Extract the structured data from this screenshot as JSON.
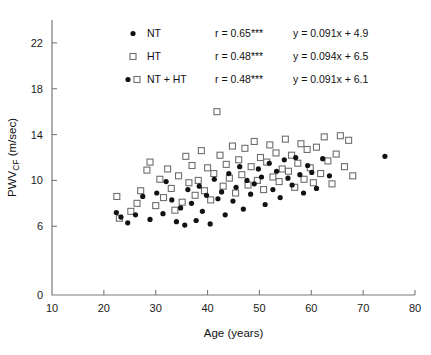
{
  "chart_data": {
    "type": "scatter",
    "title": "",
    "xlabel": "Age (years)",
    "ylabel": "PWV",
    "ylabel_sub": "CF",
    "ylabel_unit": " (m/sec)",
    "xlim": [
      10,
      80
    ],
    "ylim": [
      0,
      24
    ],
    "xticks": [
      10,
      20,
      30,
      40,
      50,
      60,
      70,
      80
    ],
    "yticks": [
      0,
      6,
      10,
      14,
      18,
      22
    ],
    "grid": false,
    "legend_position": "top-center",
    "series": [
      {
        "name": "NT",
        "marker": "filled-circle",
        "color": "#121212",
        "r": "r = 0.65***",
        "fit": "y = 0.091x + 4.9",
        "points": [
          [
            22.4,
            7.2
          ],
          [
            23.3,
            6.8
          ],
          [
            24.6,
            6.3
          ],
          [
            26.1,
            7.0
          ],
          [
            27.5,
            8.6
          ],
          [
            28.9,
            6.6
          ],
          [
            30.2,
            8.9
          ],
          [
            31.4,
            7.1
          ],
          [
            32.0,
            9.9
          ],
          [
            33.1,
            8.3
          ],
          [
            34.0,
            6.4
          ],
          [
            34.8,
            7.6
          ],
          [
            35.6,
            6.1
          ],
          [
            36.2,
            9.2
          ],
          [
            36.9,
            8.0
          ],
          [
            37.8,
            6.5
          ],
          [
            38.4,
            9.5
          ],
          [
            39.0,
            7.3
          ],
          [
            39.8,
            8.7
          ],
          [
            40.5,
            6.2
          ],
          [
            41.3,
            10.1
          ],
          [
            42.0,
            8.4
          ],
          [
            42.7,
            9.0
          ],
          [
            43.4,
            7.0
          ],
          [
            44.1,
            10.6
          ],
          [
            44.9,
            8.2
          ],
          [
            45.5,
            9.4
          ],
          [
            46.2,
            11.2
          ],
          [
            46.9,
            7.5
          ],
          [
            47.6,
            10.0
          ],
          [
            48.3,
            8.8
          ],
          [
            49.0,
            9.7
          ],
          [
            49.8,
            11.0
          ],
          [
            50.4,
            10.3
          ],
          [
            51.1,
            7.9
          ],
          [
            51.9,
            11.5
          ],
          [
            52.6,
            9.2
          ],
          [
            53.3,
            10.8
          ],
          [
            54.0,
            8.5
          ],
          [
            54.8,
            11.8
          ],
          [
            55.5,
            10.2
          ],
          [
            56.3,
            9.6
          ],
          [
            57.0,
            12.0
          ],
          [
            57.8,
            10.5
          ],
          [
            58.5,
            8.9
          ],
          [
            59.3,
            11.3
          ],
          [
            60.1,
            10.7
          ],
          [
            61.0,
            9.3
          ],
          [
            62.2,
            11.9
          ],
          [
            63.5,
            10.4
          ],
          [
            74.2,
            12.1
          ]
        ]
      },
      {
        "name": "HT",
        "marker": "open-square",
        "color": "#6e6e6e",
        "r": "r = 0.48***",
        "fit": "y = 0.094x + 6.5",
        "points": [
          [
            22.5,
            8.6
          ],
          [
            23.0,
            6.7
          ],
          [
            25.2,
            7.3
          ],
          [
            26.4,
            8.0
          ],
          [
            27.1,
            9.1
          ],
          [
            28.3,
            10.9
          ],
          [
            28.9,
            11.6
          ],
          [
            30.0,
            7.8
          ],
          [
            30.8,
            10.1
          ],
          [
            31.5,
            8.5
          ],
          [
            32.3,
            11.0
          ],
          [
            33.0,
            9.3
          ],
          [
            33.7,
            7.4
          ],
          [
            34.4,
            10.4
          ],
          [
            35.1,
            8.1
          ],
          [
            35.8,
            12.1
          ],
          [
            36.4,
            9.8
          ],
          [
            37.0,
            11.3
          ],
          [
            37.6,
            8.7
          ],
          [
            38.2,
            10.0
          ],
          [
            38.8,
            12.6
          ],
          [
            39.4,
            9.1
          ],
          [
            40.0,
            11.1
          ],
          [
            40.6,
            8.3
          ],
          [
            41.2,
            10.6
          ],
          [
            41.8,
            16.0
          ],
          [
            42.4,
            12.2
          ],
          [
            43.0,
            9.5
          ],
          [
            43.6,
            11.4
          ],
          [
            44.2,
            10.2
          ],
          [
            44.8,
            13.0
          ],
          [
            45.4,
            8.9
          ],
          [
            46.0,
            11.8
          ],
          [
            46.6,
            10.5
          ],
          [
            47.2,
            12.8
          ],
          [
            47.8,
            9.6
          ],
          [
            48.4,
            11.2
          ],
          [
            49.0,
            13.4
          ],
          [
            49.6,
            10.0
          ],
          [
            50.2,
            12.0
          ],
          [
            50.8,
            9.2
          ],
          [
            51.4,
            11.6
          ],
          [
            52.0,
            13.1
          ],
          [
            52.6,
            10.3
          ],
          [
            53.2,
            12.4
          ],
          [
            53.8,
            9.9
          ],
          [
            54.4,
            11.0
          ],
          [
            55.0,
            13.6
          ],
          [
            55.6,
            10.8
          ],
          [
            56.2,
            12.2
          ],
          [
            56.8,
            9.4
          ],
          [
            57.4,
            11.5
          ],
          [
            58.0,
            13.2
          ],
          [
            58.6,
            10.1
          ],
          [
            59.2,
            12.7
          ],
          [
            59.8,
            11.1
          ],
          [
            60.4,
            9.8
          ],
          [
            61.0,
            12.9
          ],
          [
            61.8,
            10.6
          ],
          [
            62.5,
            13.8
          ],
          [
            63.2,
            11.7
          ],
          [
            64.0,
            9.7
          ],
          [
            64.8,
            12.3
          ],
          [
            65.6,
            13.9
          ],
          [
            66.4,
            11.2
          ],
          [
            67.2,
            13.5
          ],
          [
            68.0,
            10.4
          ]
        ]
      },
      {
        "name": "NT + HT",
        "marker": "both",
        "r": "r = 0.48***",
        "fit": "y = 0.091x + 6.1",
        "points": []
      }
    ]
  },
  "legend": {
    "rows": [
      {
        "label": "NT",
        "r": "r = 0.65***",
        "fit": "y = 0.091x + 4.9",
        "marker": "dot"
      },
      {
        "label": "HT",
        "r": "r = 0.48***",
        "fit": "y = 0.094x + 6.5",
        "marker": "square"
      },
      {
        "label": "NT + HT",
        "r": "r = 0.48***",
        "fit": "y = 0.091x + 6.1",
        "marker": "dot-square"
      }
    ]
  },
  "axes": {
    "x_title": "Age (years)",
    "y_main": "PWV",
    "y_sub": "CF",
    "y_unit": "(m/sec)",
    "xtick_labels": [
      "10",
      "20",
      "30",
      "40",
      "50",
      "60",
      "70",
      "80"
    ],
    "ytick_labels": [
      "0",
      "6",
      "10",
      "14",
      "18",
      "22"
    ]
  }
}
